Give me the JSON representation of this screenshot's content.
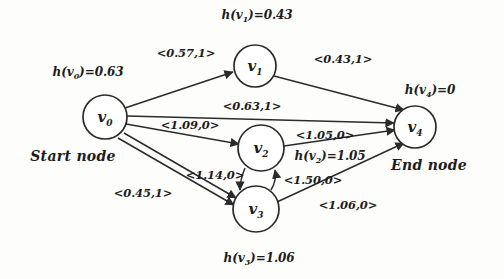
{
  "diagram": {
    "type": "graph",
    "background_color": "#fdfdfc",
    "stroke_color": "#2b2b2b",
    "nodes": [
      {
        "id": "v0",
        "label": "v",
        "sub": "0",
        "cx": 105,
        "cy": 117,
        "r": 22,
        "heuristic_text": "h(v",
        "heuristic_sub": "0",
        "heuristic_tail": ")=0.63",
        "heuristic_x": 88,
        "heuristic_y": 73,
        "terminal": "Start node",
        "terminal_x": 73,
        "terminal_y": 156
      },
      {
        "id": "v1",
        "label": "v",
        "sub": "1",
        "cx": 255,
        "cy": 66,
        "r": 21,
        "heuristic_text": "h(v",
        "heuristic_sub": "1",
        "heuristic_tail": ")=0.43",
        "heuristic_x": 257,
        "heuristic_y": 16,
        "terminal": "",
        "terminal_x": 0,
        "terminal_y": 0
      },
      {
        "id": "v2",
        "label": "v",
        "sub": "2",
        "cx": 261,
        "cy": 148,
        "r": 23,
        "heuristic_text": "h(v",
        "heuristic_sub": "2",
        "heuristic_tail": ")=1.05",
        "heuristic_x": 330,
        "heuristic_y": 157,
        "terminal": "",
        "terminal_x": 0,
        "terminal_y": 0
      },
      {
        "id": "v3",
        "label": "v",
        "sub": "3",
        "cx": 256,
        "cy": 209,
        "r": 23,
        "heuristic_text": "h(v",
        "heuristic_sub": "3",
        "heuristic_tail": ")=1.06",
        "heuristic_x": 259,
        "heuristic_y": 259,
        "terminal": "",
        "terminal_x": 0,
        "terminal_y": 0
      },
      {
        "id": "v4",
        "label": "v",
        "sub": "4",
        "cx": 415,
        "cy": 127,
        "r": 21,
        "heuristic_text": "h(v",
        "heuristic_sub": "4",
        "heuristic_tail": ")=0",
        "heuristic_x": 430,
        "heuristic_y": 91,
        "terminal": "End node",
        "terminal_x": 429,
        "terminal_y": 165
      }
    ],
    "edges": [
      {
        "from": "v0",
        "to": "v1",
        "label": "<0.57,1>",
        "cost": 0.57,
        "flag": 1,
        "label_x": 186,
        "label_y": 53
      },
      {
        "from": "v1",
        "to": "v4",
        "label": "<0.43,1>",
        "cost": 0.43,
        "flag": 1,
        "label_x": 343,
        "label_y": 59
      },
      {
        "from": "v0",
        "to": "v4",
        "label": "<0.63,1>",
        "cost": 0.63,
        "flag": 1,
        "label_x": 252,
        "label_y": 106
      },
      {
        "from": "v0",
        "to": "v2",
        "label": "<1.09,0>",
        "cost": 1.09,
        "flag": 0,
        "label_x": 190,
        "label_y": 125
      },
      {
        "from": "v2",
        "to": "v4",
        "label": "<1.05,0>",
        "cost": 1.05,
        "flag": 0,
        "label_x": 325,
        "label_y": 135
      },
      {
        "from": "v0",
        "to": "v3",
        "label": "<1.14,0>",
        "cost": 1.14,
        "flag": 0,
        "label_x": 215,
        "label_y": 175
      },
      {
        "from": "v0",
        "to": "v3",
        "label": "<0.45,1>",
        "cost": 0.45,
        "flag": 1,
        "label_x": 143,
        "label_y": 193
      },
      {
        "from": "v3",
        "to": "v2",
        "label": "<1.50,0>",
        "cost": 1.5,
        "flag": 0,
        "label_x": 313,
        "label_y": 180
      },
      {
        "from": "v3",
        "to": "v4",
        "label": "<1.06,0>",
        "cost": 1.06,
        "flag": 0,
        "label_x": 348,
        "label_y": 205
      }
    ]
  }
}
